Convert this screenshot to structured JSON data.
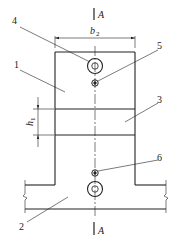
{
  "diagram": {
    "section_mark": "A",
    "dimensions": {
      "width_label": "b",
      "width_subscript": "2",
      "height_label": "h",
      "height_subscript": "1"
    },
    "callouts": [
      {
        "id": "1",
        "label": "1"
      },
      {
        "id": "2",
        "label": "2"
      },
      {
        "id": "3",
        "label": "3"
      },
      {
        "id": "4",
        "label": "4"
      },
      {
        "id": "5",
        "label": "5"
      },
      {
        "id": "6",
        "label": "6"
      }
    ],
    "colors": {
      "line": "#222222",
      "background": "#ffffff"
    }
  }
}
